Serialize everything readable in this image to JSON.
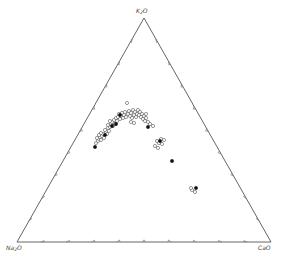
{
  "chart_data": {
    "type": "scatter",
    "subtype": "ternary",
    "title": "",
    "apices": {
      "top": {
        "label": "K2O",
        "base": "K",
        "sub": "2",
        "suffix": "O"
      },
      "left": {
        "label": "Na2O",
        "base": "Na",
        "sub": "2",
        "suffix": "O"
      },
      "right": {
        "label": "CaO",
        "base": "CaO",
        "sub": "",
        "suffix": ""
      }
    },
    "ticks_per_side": 10,
    "tick_interval_percent": 10,
    "grid": false,
    "legend": null,
    "series": [
      {
        "name": "open circles",
        "marker": "open-circle",
        "color": "#555555",
        "points_px": [
          [
            96,
            143
          ],
          [
            98,
            141
          ],
          [
            99,
            139
          ],
          [
            97,
            138
          ],
          [
            100,
            137
          ],
          [
            101,
            140
          ],
          [
            102,
            136
          ],
          [
            99,
            135
          ],
          [
            103,
            134
          ],
          [
            104,
            138
          ],
          [
            101,
            133
          ],
          [
            106,
            132
          ],
          [
            107,
            134
          ],
          [
            105,
            130
          ],
          [
            108,
            128
          ],
          [
            109,
            131
          ],
          [
            110,
            127
          ],
          [
            111,
            124
          ],
          [
            108,
            125
          ],
          [
            112,
            122
          ],
          [
            113,
            126
          ],
          [
            110,
            121
          ],
          [
            114,
            120
          ],
          [
            115,
            124
          ],
          [
            116,
            118
          ],
          [
            117,
            121
          ],
          [
            118,
            117
          ],
          [
            119,
            114
          ],
          [
            121,
            116
          ],
          [
            120,
            119
          ],
          [
            122,
            113
          ],
          [
            123,
            118
          ],
          [
            124,
            115
          ],
          [
            125,
            112
          ],
          [
            126,
            117
          ],
          [
            127,
            103
          ],
          [
            128,
            114
          ],
          [
            129,
            111
          ],
          [
            130,
            116
          ],
          [
            131,
            113
          ],
          [
            132,
            118
          ],
          [
            133,
            110
          ],
          [
            134,
            115
          ],
          [
            135,
            112
          ],
          [
            136,
            117
          ],
          [
            137,
            114
          ],
          [
            138,
            110
          ],
          [
            139,
            115
          ],
          [
            140,
            112
          ],
          [
            141,
            117
          ],
          [
            142,
            114
          ],
          [
            143,
            119
          ],
          [
            144,
            116
          ],
          [
            145,
            121
          ],
          [
            146,
            118
          ],
          [
            148,
            122
          ],
          [
            150,
            124
          ],
          [
            146,
            114
          ],
          [
            134,
            123
          ],
          [
            131,
            122
          ],
          [
            153,
            126
          ],
          [
            155,
            146
          ],
          [
            157,
            141
          ],
          [
            159,
            143
          ],
          [
            161,
            139
          ],
          [
            162,
            144
          ],
          [
            158,
            148
          ],
          [
            164,
            140
          ],
          [
            192,
            190
          ],
          [
            195,
            192
          ],
          [
            191,
            188
          ]
        ]
      },
      {
        "name": "filled circles",
        "marker": "filled-circle",
        "color": "#111111",
        "points_px": [
          [
            95,
            147
          ],
          [
            105,
            135
          ],
          [
            112,
            126
          ],
          [
            116,
            124
          ],
          [
            120,
            115
          ],
          [
            148,
            127
          ],
          [
            160,
            141
          ],
          [
            172,
            161
          ],
          [
            196,
            188
          ]
        ]
      }
    ],
    "triangle_px": {
      "top": [
        144,
        18
      ],
      "left": [
        17,
        242
      ],
      "right": [
        271,
        242
      ]
    }
  }
}
